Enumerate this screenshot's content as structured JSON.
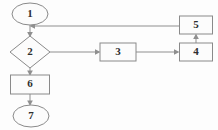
{
  "diagram": {
    "type": "flowchart",
    "width": 218,
    "height": 130,
    "background_color": "#fdfdfd",
    "stroke_color": "#8a8a8a",
    "text_color": "#2e2e2e",
    "nodes": [
      {
        "id": "n1",
        "label": "1",
        "shape": "ellipse",
        "role": "start",
        "cx": 30,
        "cy": 14,
        "rx": 18,
        "ry": 11
      },
      {
        "id": "n2",
        "label": "2",
        "shape": "diamond",
        "role": "decision",
        "cx": 30,
        "cy": 52,
        "rx": 20,
        "ry": 16
      },
      {
        "id": "n3",
        "label": "3",
        "shape": "rect",
        "role": "process",
        "cx": 118,
        "cy": 52,
        "w": 36,
        "h": 18
      },
      {
        "id": "n4",
        "label": "4",
        "shape": "rect",
        "role": "process",
        "cx": 196,
        "cy": 52,
        "w": 33,
        "h": 18
      },
      {
        "id": "n5",
        "label": "5",
        "shape": "rect",
        "role": "process",
        "cx": 196,
        "cy": 25,
        "w": 33,
        "h": 18
      },
      {
        "id": "n6",
        "label": "6",
        "shape": "rect",
        "role": "process",
        "cx": 30,
        "cy": 84,
        "w": 39,
        "h": 19
      },
      {
        "id": "n7",
        "label": "7",
        "shape": "ellipse",
        "role": "end",
        "cx": 31,
        "cy": 116,
        "rx": 18,
        "ry": 11
      }
    ],
    "edges": [
      {
        "id": "e1",
        "from": "n1",
        "to": "n2",
        "label": "",
        "direction": "down",
        "points": "30,25 30,35",
        "arrow_at": "30,36",
        "arrow_dir": "down"
      },
      {
        "id": "e2",
        "from": "n2",
        "to": "n3",
        "label": "",
        "direction": "right",
        "points": "50,52 98,52",
        "arrow_at": "100,52",
        "arrow_dir": "right"
      },
      {
        "id": "e3",
        "from": "n3",
        "to": "n4",
        "label": "",
        "direction": "right",
        "points": "136,52 177,52",
        "arrow_at": "179,52",
        "arrow_dir": "right"
      },
      {
        "id": "e4",
        "from": "n4",
        "to": "n5",
        "label": "",
        "direction": "up",
        "points": "196,43 196,36",
        "arrow_at": "196,34",
        "arrow_dir": "up"
      },
      {
        "id": "e5",
        "from": "n5",
        "to": "e1",
        "label": "",
        "direction": "left",
        "points": "179,26 33,26",
        "arrow_at": "30,26",
        "arrow_dir": "left"
      },
      {
        "id": "e6",
        "from": "n2",
        "to": "n6",
        "label": "",
        "direction": "down",
        "points": "30,68 30,73",
        "arrow_at": "30,75",
        "arrow_dir": "down"
      },
      {
        "id": "e7",
        "from": "n6",
        "to": "n7",
        "label": "",
        "direction": "down",
        "points": "30,94 30,103",
        "arrow_at": "30,105",
        "arrow_dir": "down"
      }
    ]
  }
}
